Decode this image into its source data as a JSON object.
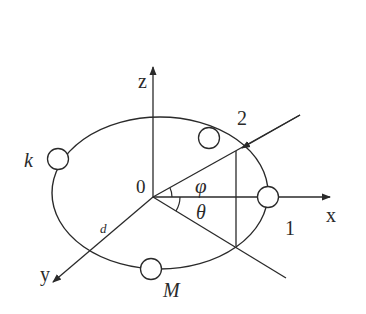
{
  "diagram": {
    "axes": {
      "x_label": "x",
      "y_label": "y",
      "z_label": "z",
      "origin_label": "0"
    },
    "angle_labels": {
      "phi": "φ",
      "theta": "θ"
    },
    "path_labels": {
      "incoming_ray": "2",
      "x_axis_sensor": "1",
      "distance": "d"
    },
    "node_labels": {
      "k": "k",
      "M": "M"
    },
    "nodes": [
      {
        "name": "node-k",
        "cx": 58,
        "cy": 159
      },
      {
        "name": "node-top",
        "cx": 209,
        "cy": 138
      },
      {
        "name": "node-1",
        "cx": 268,
        "cy": 197
      },
      {
        "name": "node-M",
        "cx": 151,
        "cy": 269
      }
    ],
    "colors": {
      "stroke": "#2a2a2a",
      "background": "#ffffff"
    }
  }
}
